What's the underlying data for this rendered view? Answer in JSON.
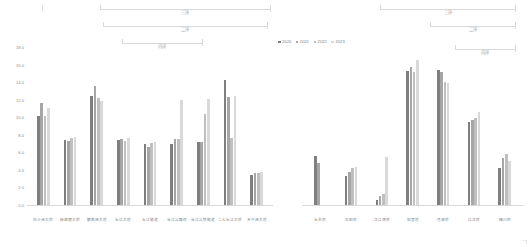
{
  "legend": {
    "items": [
      {
        "label": "2020",
        "color": "#7f7f7f"
      },
      {
        "label": "2021",
        "color": "#a6a6a6"
      },
      {
        "label": "2022",
        "color": "#bfbfbf"
      },
      {
        "label": "2023",
        "color": "#d9d9d9"
      }
    ]
  },
  "axis": {
    "yticks": [
      "18.0",
      "16.0",
      "14.0",
      "12.0",
      "10.0",
      "8.0",
      "6.0",
      "4.0",
      "2.0",
      "0.0"
    ],
    "ymin": 0,
    "ymax": 18,
    "ystep": 2
  },
  "brackets": {
    "left": [
      {
        "label": "三环",
        "name": "bracket-left-sanhuan"
      },
      {
        "label": "二环",
        "name": "bracket-left-erhuan"
      },
      {
        "label": "内环",
        "name": "bracket-left-neihuan"
      }
    ],
    "right": [
      {
        "label": "三环",
        "name": "bracket-right-sanhuan"
      },
      {
        "label": "二环",
        "name": "bracket-right-erhuan"
      },
      {
        "label": "内环",
        "name": "bracket-right-neihuan"
      }
    ]
  },
  "chart_data": [
    {
      "type": "bar",
      "title": "",
      "xlabel": "",
      "ylabel": "",
      "ylim": [
        0,
        18
      ],
      "grid": false,
      "legend_position": "top-center",
      "categories": [
        "白沙洲大桥",
        "杨泗港大桥",
        "鹦鹉洲大桥",
        "长江大桥",
        "长江隧道",
        "长江公路桥",
        "长江公铁隧道",
        "二七长江大桥",
        "天兴洲大桥"
      ],
      "series": [
        {
          "name": "2020",
          "values": [
            10.1,
            7.4,
            12.4,
            7.4,
            6.9,
            7.0,
            7.2,
            14.2,
            3.4,
            15.6,
            7.4
          ]
        },
        {
          "name": "2021",
          "values": [
            11.6,
            7.3,
            13.6,
            7.5,
            6.6,
            7.5,
            7.2,
            12.3,
            3.7,
            16.0,
            7.5
          ]
        },
        {
          "name": "2022",
          "values": [
            10.1,
            7.6,
            12.2,
            7.3,
            7.1,
            7.5,
            10.4,
            7.6,
            3.6,
            14.7,
            6.7
          ]
        },
        {
          "name": "2023",
          "values": [
            11.0,
            7.8,
            11.8,
            7.6,
            7.2,
            12.0,
            12.1,
            12.4,
            3.8,
            16.3,
            7.0
          ]
        }
      ]
    },
    {
      "type": "bar",
      "title": "",
      "xlabel": "",
      "ylabel": "",
      "ylim": [
        0,
        18
      ],
      "grid": false,
      "legend_position": "top-center",
      "categories": [
        "长丰桥",
        "古田桥",
        "汉江湾桥",
        "知音桥",
        "月湖桥",
        "江汉桥",
        "晴川桥"
      ],
      "series": [
        {
          "name": "2020",
          "values": [
            5.6,
            3.3,
            0.6,
            15.3,
            15.4,
            9.5,
            4.2
          ]
        },
        {
          "name": "2021",
          "values": [
            4.8,
            3.8,
            1.0,
            15.7,
            15.2,
            9.7,
            5.3
          ]
        },
        {
          "name": "2022",
          "values": [
            0.0,
            4.2,
            1.2,
            15.2,
            14.0,
            9.9,
            5.8
          ]
        },
        {
          "name": "2023",
          "values": [
            0.0,
            4.3,
            5.5,
            16.5,
            13.9,
            10.6,
            5.0
          ]
        }
      ]
    }
  ]
}
